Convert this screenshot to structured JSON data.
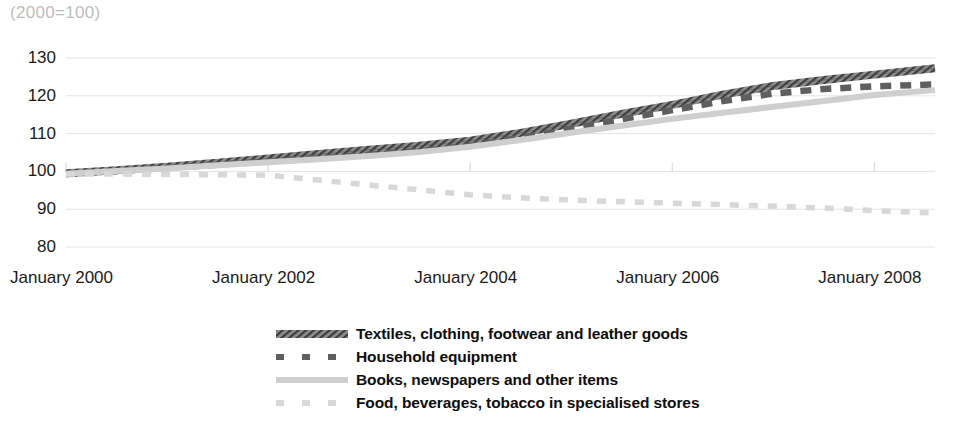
{
  "chart_data": {
    "type": "line",
    "title": "(2000=100)",
    "xlabel": "",
    "ylabel": "",
    "ylim": [
      80,
      130
    ],
    "yticks": [
      80,
      90,
      100,
      110,
      120,
      130
    ],
    "grid": true,
    "legend_position": "bottom",
    "x_tick_labels": [
      "January  2000",
      "January  2002",
      "January  2004",
      "January  2006",
      "January  2008"
    ],
    "x_tick_years": [
      2000,
      2002,
      2004,
      2006,
      2008
    ],
    "x_range": [
      2000,
      2008.6
    ],
    "series": [
      {
        "name": "Textiles, clothing, footwear and leather goods",
        "style": "hatched-thick",
        "color": "#6e6e6e",
        "x": [
          2000.0,
          2000.5,
          2001.0,
          2001.5,
          2002.0,
          2002.5,
          2003.0,
          2003.5,
          2004.0,
          2004.5,
          2005.0,
          2005.5,
          2006.0,
          2006.5,
          2007.0,
          2007.5,
          2008.0,
          2008.6
        ],
        "values": [
          99.5,
          100.3,
          101.2,
          102.3,
          103.4,
          104.6,
          105.7,
          106.8,
          108.1,
          110.2,
          112.6,
          115.2,
          117.6,
          120.3,
          122.6,
          124.2,
          125.6,
          127.3
        ]
      },
      {
        "name": "Household equipment",
        "style": "dashed-dark",
        "color": "#5f5f5f",
        "x": [
          2000.0,
          2000.5,
          2001.0,
          2001.5,
          2002.0,
          2002.5,
          2003.0,
          2003.5,
          2004.0,
          2004.5,
          2005.0,
          2005.5,
          2006.0,
          2006.5,
          2007.0,
          2007.5,
          2008.0,
          2008.6
        ],
        "values": [
          99.3,
          100.1,
          100.9,
          101.8,
          102.6,
          103.5,
          104.4,
          105.4,
          106.8,
          108.9,
          111.3,
          113.8,
          116.2,
          118.6,
          120.6,
          121.8,
          122.5,
          123.0
        ]
      },
      {
        "name": "Books, newspapers and other items",
        "style": "solid-light",
        "color": "#cfcfcf",
        "x": [
          2000.0,
          2000.5,
          2001.0,
          2001.5,
          2002.0,
          2002.5,
          2003.0,
          2003.5,
          2004.0,
          2004.5,
          2005.0,
          2005.5,
          2006.0,
          2006.5,
          2007.0,
          2007.5,
          2008.0,
          2008.6
        ],
        "values": [
          99.4,
          100.1,
          100.8,
          101.6,
          102.4,
          103.2,
          104.1,
          105.1,
          106.5,
          108.3,
          110.2,
          112.1,
          113.9,
          115.5,
          117.1,
          118.6,
          120.2,
          121.5
        ]
      },
      {
        "name": "Food, beverages, tobacco in specialised stores",
        "style": "dashed-light",
        "color": "#d8d8d8",
        "x": [
          2000.0,
          2000.5,
          2001.0,
          2001.5,
          2002.0,
          2002.5,
          2003.0,
          2003.5,
          2004.0,
          2004.5,
          2005.0,
          2005.5,
          2006.0,
          2006.5,
          2007.0,
          2007.5,
          2008.0,
          2008.6
        ],
        "values": [
          99.3,
          99.3,
          99.2,
          99.1,
          99.0,
          97.7,
          96.4,
          95.1,
          93.8,
          93.0,
          92.4,
          92.0,
          91.6,
          91.2,
          90.8,
          90.3,
          89.6,
          89.0
        ]
      }
    ]
  },
  "legend": {
    "items": [
      {
        "label": "Textiles, clothing, footwear and leather goods",
        "swatch": "hatched-thick"
      },
      {
        "label": "Household equipment",
        "swatch": "dashed-dark"
      },
      {
        "label": "Books, newspapers and other items",
        "swatch": "solid-light"
      },
      {
        "label": "Food, beverages, tobacco in specialised stores",
        "swatch": "dashed-light"
      }
    ]
  }
}
